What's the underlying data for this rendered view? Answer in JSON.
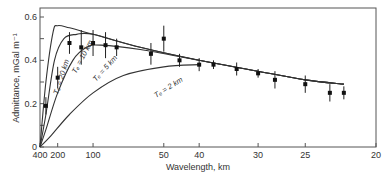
{
  "chart_data": {
    "type": "scatter",
    "title": "",
    "xlabel": "Wavelength, km",
    "ylabel": "Admittance, mGal m⁻¹",
    "x_tick_labels": [
      "400",
      "200",
      "100",
      "50",
      "40",
      "30",
      "25",
      "20"
    ],
    "y_tick_labels": [
      "0",
      "0.2",
      "0.4",
      "0.6"
    ],
    "xlim": [
      400,
      20
    ],
    "ylim": [
      0,
      0.6
    ],
    "x_scale": "wavenumber (1/wavelength)",
    "grid": false,
    "legend": "curve labels inline",
    "observed": {
      "name": "Observed admittance",
      "wavelength_km": [
        300,
        200,
        150,
        120,
        100,
        85,
        75,
        50,
        55,
        45,
        40,
        37,
        33,
        30,
        28,
        25,
        23,
        22
      ],
      "values": [
        0.19,
        0.32,
        0.48,
        0.46,
        0.48,
        0.47,
        0.46,
        0.5,
        0.43,
        0.4,
        0.38,
        0.38,
        0.36,
        0.34,
        0.31,
        0.29,
        0.25,
        0.25
      ]
    },
    "series": [
      {
        "name": "Te = 20 km",
        "label": "Tₑ = 20 km",
        "points": [
          [
            400,
            0
          ],
          [
            300,
            0.3
          ],
          [
            230,
            0.53
          ],
          [
            200,
            0.56
          ],
          [
            150,
            0.55
          ],
          [
            100,
            0.52
          ],
          [
            60,
            0.46
          ],
          [
            40,
            0.4
          ],
          [
            30,
            0.35
          ],
          [
            25,
            0.31
          ],
          [
            22,
            0.29
          ]
        ]
      },
      {
        "name": "Te = 10 km",
        "label": "Tₑ = 10 km",
        "points": [
          [
            400,
            0
          ],
          [
            300,
            0.15
          ],
          [
            220,
            0.4
          ],
          [
            170,
            0.5
          ],
          [
            130,
            0.52
          ],
          [
            100,
            0.52
          ],
          [
            60,
            0.46
          ],
          [
            40,
            0.4
          ],
          [
            30,
            0.35
          ],
          [
            25,
            0.31
          ],
          [
            22,
            0.29
          ]
        ]
      },
      {
        "name": "Te = 5 km",
        "label": "Tₑ = 5 km",
        "points": [
          [
            400,
            0
          ],
          [
            300,
            0.08
          ],
          [
            200,
            0.25
          ],
          [
            140,
            0.4
          ],
          [
            110,
            0.46
          ],
          [
            90,
            0.47
          ],
          [
            60,
            0.45
          ],
          [
            40,
            0.4
          ],
          [
            30,
            0.35
          ],
          [
            25,
            0.31
          ],
          [
            22,
            0.29
          ]
        ]
      },
      {
        "name": "Te = 2 km",
        "label": "Tₑ = 2 km",
        "points": [
          [
            400,
            0
          ],
          [
            250,
            0.05
          ],
          [
            150,
            0.15
          ],
          [
            100,
            0.25
          ],
          [
            70,
            0.33
          ],
          [
            50,
            0.37
          ],
          [
            40,
            0.38
          ]
        ]
      }
    ]
  }
}
